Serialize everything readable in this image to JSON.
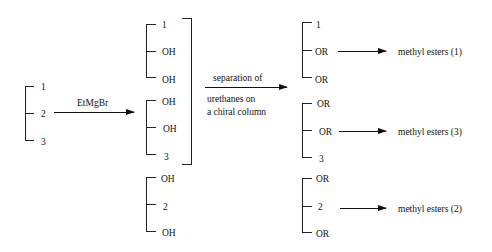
{
  "start": {
    "labels": [
      "1",
      "2",
      "3"
    ]
  },
  "reagent": {
    "label": "EtMgBr"
  },
  "intermediates": [
    {
      "labels": [
        "1",
        "OH",
        "OH"
      ]
    },
    {
      "labels": [
        "OH",
        "OH",
        "3"
      ]
    },
    {
      "labels": [
        "OH",
        "2",
        "OH"
      ]
    }
  ],
  "separation": {
    "lines": [
      "separation of",
      "urethanes on",
      "a chiral column"
    ]
  },
  "products": [
    {
      "labels": [
        "1",
        "OR",
        "OR"
      ],
      "result": "methyl esters (1)"
    },
    {
      "labels": [
        "OR",
        "OR",
        "3"
      ],
      "result": "methyl esters (3)"
    },
    {
      "labels": [
        "OR",
        "2",
        "OR"
      ],
      "result": "methyl esters (2)"
    }
  ]
}
